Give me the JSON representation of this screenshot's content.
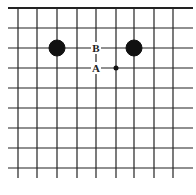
{
  "diagram": {
    "type": "go-board-fragment",
    "grid": {
      "vertical_x": [
        18,
        37,
        57,
        77,
        96,
        116,
        134,
        154,
        173
      ],
      "horizontal_y": [
        8,
        28,
        48,
        68,
        88,
        108,
        128,
        148,
        168
      ],
      "x_extent": [
        8,
        193
      ],
      "y_extent_bottom": 178,
      "top_edge_thick": true,
      "line_color": "#222222"
    },
    "stones": [
      {
        "color": "black",
        "x": 57,
        "y": 48,
        "r": 8
      },
      {
        "color": "black",
        "x": 134,
        "y": 48,
        "r": 8
      }
    ],
    "markers": [
      {
        "type": "dot",
        "x": 116,
        "y": 68,
        "r": 2.5
      }
    ],
    "labels": [
      {
        "text": "B",
        "x": 96,
        "y": 48
      },
      {
        "text": "A",
        "x": 96,
        "y": 68
      }
    ]
  }
}
